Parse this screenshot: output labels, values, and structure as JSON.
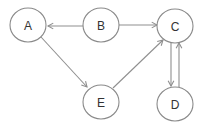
{
  "diagram": {
    "type": "directed-graph",
    "colors": {
      "node_stroke": "#8a8a8a",
      "edge_stroke": "#8f8f8f",
      "label": "#333333",
      "background": "#ffffff"
    },
    "nodes": [
      {
        "id": "A",
        "label": "A",
        "cx": 28,
        "cy": 25,
        "rx": 18,
        "ry": 17
      },
      {
        "id": "B",
        "label": "B",
        "cx": 101,
        "cy": 25,
        "rx": 18,
        "ry": 17
      },
      {
        "id": "C",
        "label": "C",
        "cx": 175,
        "cy": 26,
        "rx": 18,
        "ry": 17
      },
      {
        "id": "E",
        "label": "E",
        "cx": 101,
        "cy": 102,
        "rx": 18,
        "ry": 17
      },
      {
        "id": "D",
        "label": "D",
        "cx": 175,
        "cy": 104,
        "rx": 18,
        "ry": 17
      }
    ],
    "edges": [
      {
        "from": "B",
        "to": "A",
        "x1": 83,
        "y1": 26,
        "x2": 48,
        "y2": 26
      },
      {
        "from": "B",
        "to": "C",
        "x1": 119,
        "y1": 25,
        "x2": 157,
        "y2": 25
      },
      {
        "from": "A",
        "to": "E",
        "x1": 41,
        "y1": 37,
        "x2": 87,
        "y2": 87
      },
      {
        "from": "E",
        "to": "C",
        "x1": 113,
        "y1": 88,
        "x2": 163,
        "y2": 40
      },
      {
        "from": "C",
        "to": "D",
        "x1": 171,
        "y1": 43,
        "x2": 171,
        "y2": 86
      },
      {
        "from": "D",
        "to": "C",
        "x1": 179,
        "y1": 87,
        "x2": 179,
        "y2": 43
      }
    ]
  }
}
